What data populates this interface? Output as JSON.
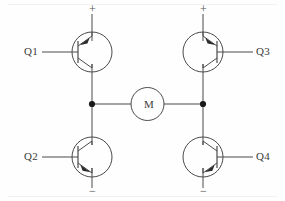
{
  "diagram": {
    "stroke_color": "#4a4a4a",
    "node_color": "#1a1a1a",
    "background_color": "#fefefe"
  },
  "supply": {
    "left_positive": "+",
    "left_negative": "−",
    "right_positive": "+",
    "right_negative": "−"
  },
  "transistors": [
    {
      "label": "Q1",
      "type": "pnp",
      "position": "top-left"
    },
    {
      "label": "Q2",
      "type": "npn",
      "position": "bottom-left"
    },
    {
      "label": "Q3",
      "type": "pnp",
      "position": "top-right"
    },
    {
      "label": "Q4",
      "type": "npn",
      "position": "bottom-right"
    }
  ],
  "motor": {
    "label": "M",
    "symbol": "motor-circle"
  }
}
